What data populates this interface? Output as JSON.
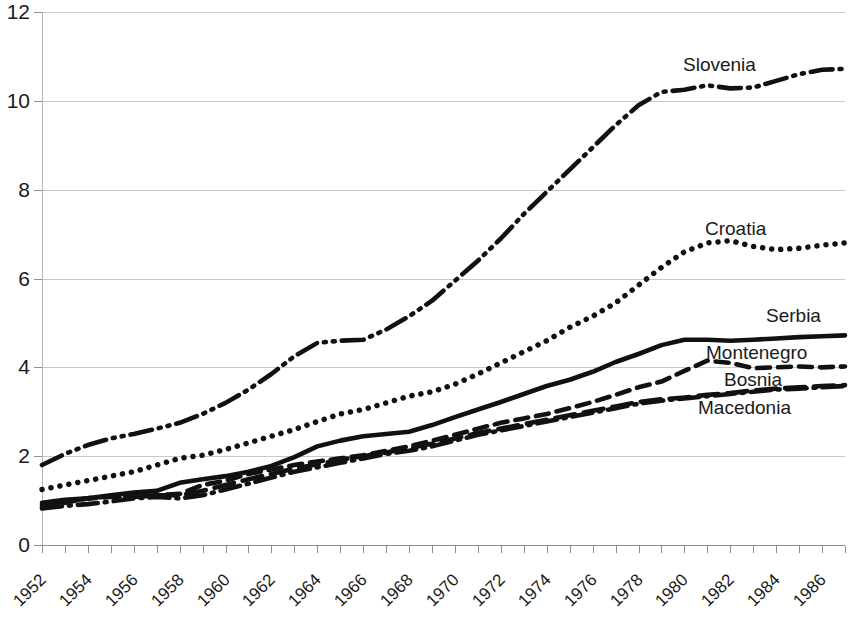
{
  "chart_data": {
    "type": "line",
    "title": "",
    "xlabel": "",
    "ylabel": "",
    "xlim": [
      1952,
      1987
    ],
    "ylim": [
      0,
      12
    ],
    "ytick_values": [
      0,
      2,
      4,
      6,
      8,
      10,
      12
    ],
    "ytick_labels": [
      "0",
      "2",
      "4",
      "6",
      "8",
      "10",
      "12"
    ],
    "xtick_labels": [
      "1952",
      "1954",
      "1956",
      "1958",
      "1960",
      "1962",
      "1964",
      "1966",
      "1968",
      "1970",
      "1972",
      "1974",
      "1976",
      "1978",
      "1980",
      "1982",
      "1984",
      "1986"
    ],
    "xtick_values": [
      1952,
      1954,
      1956,
      1958,
      1960,
      1962,
      1964,
      1966,
      1968,
      1970,
      1972,
      1974,
      1976,
      1978,
      1980,
      1982,
      1984,
      1986
    ],
    "minor_xticks_every": 1,
    "grid": "horizontal",
    "legend_position": "inline-right-of-curve",
    "x": [
      1952,
      1953,
      1954,
      1955,
      1956,
      1957,
      1958,
      1959,
      1960,
      1961,
      1962,
      1963,
      1964,
      1965,
      1966,
      1967,
      1968,
      1969,
      1970,
      1971,
      1972,
      1973,
      1974,
      1975,
      1976,
      1977,
      1978,
      1979,
      1980,
      1981,
      1982,
      1983,
      1984,
      1985,
      1986,
      1987
    ],
    "series": [
      {
        "name": "Slovenia",
        "style": "dash-dot-dot",
        "color": "#111111",
        "label_x": 1987,
        "values": [
          1.8,
          2.05,
          2.25,
          2.4,
          2.5,
          2.62,
          2.75,
          2.95,
          3.2,
          3.5,
          3.85,
          4.25,
          4.55,
          4.6,
          4.62,
          4.85,
          5.15,
          5.5,
          5.95,
          6.4,
          6.9,
          7.45,
          7.95,
          8.45,
          8.95,
          9.45,
          9.9,
          10.2,
          10.25,
          10.35,
          10.28,
          10.3,
          10.45,
          10.6,
          10.7,
          10.72
        ]
      },
      {
        "name": "Croatia",
        "style": "dotted",
        "color": "#111111",
        "label_x": 1987,
        "values": [
          1.25,
          1.35,
          1.45,
          1.55,
          1.65,
          1.8,
          1.95,
          2.02,
          2.15,
          2.3,
          2.45,
          2.6,
          2.78,
          2.95,
          3.05,
          3.2,
          3.35,
          3.45,
          3.62,
          3.85,
          4.1,
          4.35,
          4.6,
          4.9,
          5.15,
          5.45,
          5.85,
          6.25,
          6.6,
          6.8,
          6.85,
          6.72,
          6.65,
          6.68,
          6.75,
          6.8
        ]
      },
      {
        "name": "Serbia",
        "style": "solid",
        "color": "#111111",
        "label_x": 1987,
        "values": [
          0.95,
          1.02,
          1.05,
          1.12,
          1.18,
          1.22,
          1.4,
          1.48,
          1.55,
          1.65,
          1.78,
          1.98,
          2.22,
          2.35,
          2.45,
          2.5,
          2.55,
          2.7,
          2.88,
          3.05,
          3.22,
          3.4,
          3.58,
          3.72,
          3.9,
          4.12,
          4.3,
          4.5,
          4.62,
          4.62,
          4.6,
          4.62,
          4.65,
          4.68,
          4.7,
          4.72
        ]
      },
      {
        "name": "Montenegro",
        "style": "dashed",
        "color": "#111111",
        "label_x": 1987,
        "values": [
          0.85,
          0.95,
          1.05,
          1.08,
          1.1,
          1.12,
          1.15,
          1.35,
          1.45,
          1.6,
          1.7,
          1.8,
          1.88,
          1.95,
          2.02,
          2.12,
          2.22,
          2.35,
          2.48,
          2.62,
          2.75,
          2.85,
          2.95,
          3.08,
          3.22,
          3.38,
          3.55,
          3.68,
          3.92,
          4.15,
          4.1,
          3.98,
          4.0,
          4.02,
          4.0,
          4.02
        ]
      },
      {
        "name": "Bosnia",
        "style": "long-dash",
        "color": "#111111",
        "label_x": 1987,
        "values": [
          0.9,
          0.98,
          1.05,
          1.1,
          1.08,
          1.12,
          1.12,
          1.22,
          1.35,
          1.48,
          1.6,
          1.72,
          1.82,
          1.92,
          2.0,
          2.08,
          2.18,
          2.28,
          2.4,
          2.52,
          2.62,
          2.72,
          2.82,
          2.92,
          3.02,
          3.12,
          3.22,
          3.28,
          3.32,
          3.38,
          3.42,
          3.48,
          3.52,
          3.55,
          3.58,
          3.6
        ]
      },
      {
        "name": "Macedonia",
        "style": "dash-dot",
        "color": "#111111",
        "label_x": 1987,
        "values": [
          0.82,
          0.88,
          0.92,
          0.98,
          1.05,
          1.08,
          1.05,
          1.12,
          1.25,
          1.38,
          1.52,
          1.65,
          1.75,
          1.85,
          1.95,
          2.05,
          2.12,
          2.22,
          2.35,
          2.48,
          2.58,
          2.68,
          2.78,
          2.88,
          2.98,
          3.08,
          3.18,
          3.25,
          3.3,
          3.35,
          3.4,
          3.45,
          3.5,
          3.52,
          3.55,
          3.58
        ]
      }
    ],
    "labels_on_chart": [
      {
        "name": "Slovenia",
        "text": "Slovenia",
        "x": 683,
        "y": 55
      },
      {
        "name": "Croatia",
        "text": "Croatia",
        "x": 705,
        "y": 219
      },
      {
        "name": "Serbia",
        "text": "Serbia",
        "x": 766,
        "y": 306
      },
      {
        "name": "Montenegro",
        "text": "Montenegro",
        "x": 706,
        "y": 343
      },
      {
        "name": "Bosnia",
        "text": "Bosnia",
        "x": 724,
        "y": 370
      },
      {
        "name": "Macedonia",
        "text": "Macedonia",
        "x": 698,
        "y": 398
      }
    ]
  }
}
